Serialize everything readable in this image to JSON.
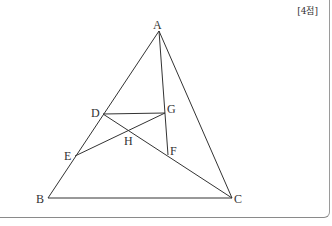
{
  "score_label": "[4점]",
  "diagram": {
    "points": {
      "A": {
        "label": "A",
        "x": 159,
        "y": 31
      },
      "B": {
        "label": "B",
        "x": 48,
        "y": 198
      },
      "C": {
        "label": "C",
        "x": 232,
        "y": 198
      },
      "D": {
        "label": "D",
        "x": 103,
        "y": 114
      },
      "E": {
        "label": "E",
        "x": 75,
        "y": 156
      },
      "F": {
        "label": "F",
        "x": 168,
        "y": 155
      },
      "G": {
        "label": "G",
        "x": 165,
        "y": 113
      },
      "H": {
        "label": "H",
        "x": 129,
        "y": 130
      }
    },
    "segments": [
      [
        "A",
        "B"
      ],
      [
        "B",
        "C"
      ],
      [
        "C",
        "A"
      ],
      [
        "A",
        "F"
      ],
      [
        "D",
        "G"
      ],
      [
        "D",
        "C"
      ],
      [
        "E",
        "G"
      ]
    ],
    "line_color": "#333333"
  }
}
